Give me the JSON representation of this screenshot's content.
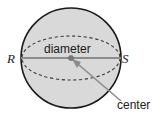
{
  "figure": {
    "labels": {
      "left_endpoint": "R",
      "right_endpoint": "S",
      "diameter": "diameter",
      "center": "center"
    },
    "colors": {
      "sphere_fill": "#d9d9d9",
      "sphere_outline": "#1a1a1a",
      "equator_dash": "#3a3a3a",
      "diameter_line": "#8c8c8c",
      "center_dot": "#7a7a7a",
      "leader_line": "#8c8c8c",
      "text": "#1a1a1a",
      "background": "#ffffff"
    },
    "geometry": {
      "circle_center_x": 71,
      "circle_center_y": 58,
      "circle_radius": 50,
      "equator_rx": 50,
      "equator_ry": 22,
      "diameter_left_x": 21,
      "diameter_right_x": 121,
      "diameter_y": 58,
      "center_dot_radius": 2.6,
      "leader_start_x": 71,
      "leader_start_y": 58,
      "leader_end_x": 121,
      "leader_end_y": 101
    }
  }
}
